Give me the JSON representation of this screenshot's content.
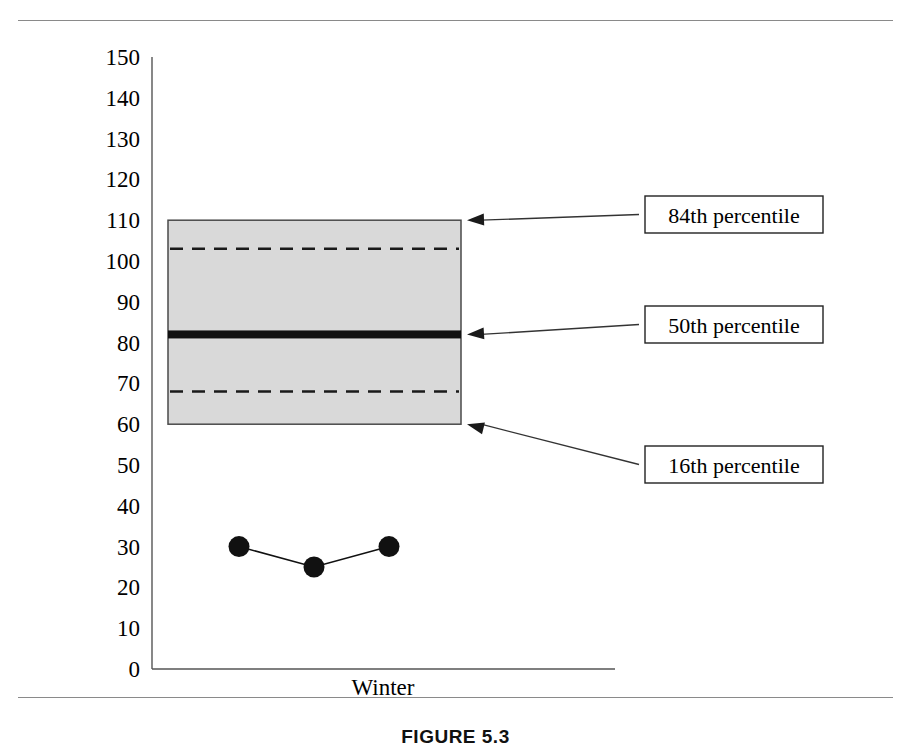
{
  "figure": {
    "caption": "FIGURE 5.3"
  },
  "chart_data": {
    "type": "box",
    "title": "",
    "xlabel": "Winter",
    "ylabel": "",
    "categories": [
      "Winter"
    ],
    "ylim": [
      0,
      150
    ],
    "ytick_step": 10,
    "yticks": [
      0,
      10,
      20,
      30,
      40,
      50,
      60,
      70,
      80,
      90,
      100,
      110,
      120,
      130,
      140,
      150
    ],
    "ytick_labels": [
      "0",
      "10",
      "20",
      "30",
      "40",
      "50",
      "60",
      "70",
      "80",
      "90",
      "100",
      "110",
      "120",
      "130",
      "140",
      "150"
    ],
    "grid": false,
    "legend_position": "none",
    "box": {
      "top": 110,
      "bottom": 60,
      "median": 82,
      "upper_dashed": 103,
      "lower_dashed": 68,
      "fill_color": "#d9d9d9",
      "edge_color": "#4a4a4a"
    },
    "annotations": [
      {
        "label": "84th percentile",
        "value": 110,
        "target": "box-top"
      },
      {
        "label": "50th percentile",
        "value": 82,
        "target": "median"
      },
      {
        "label": "16th percentile",
        "value": 60,
        "target": "box-bottom"
      }
    ],
    "series": [
      {
        "name": "observed",
        "marker": "filled-circle",
        "color": "#111111",
        "x": [
          1,
          2,
          3
        ],
        "values": [
          30,
          25,
          30
        ]
      }
    ]
  }
}
